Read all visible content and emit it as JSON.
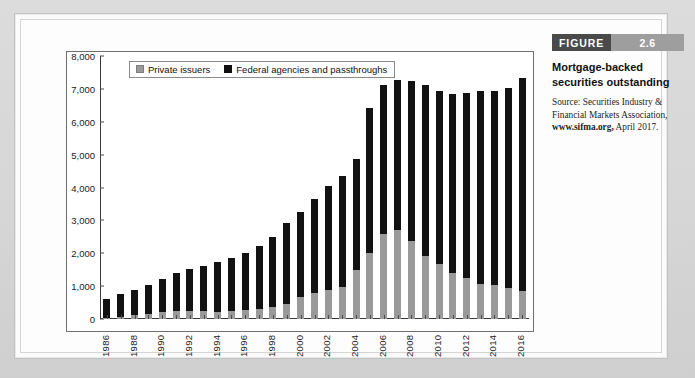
{
  "caption": {
    "figure_word": "FIGURE",
    "figure_number": "2.6",
    "title": "Mortgage-backed securities outstanding",
    "source_prefix": "Source: Securities Industry & Financial Markets Association, ",
    "source_link": "www.sifma.org,",
    "source_suffix": " April 2017."
  },
  "colors": {
    "private_issuers": "#9a9a9a",
    "federal_agencies": "#121212",
    "figure_word_bg": "#4a4a4a",
    "figure_num_bg": "#9e9e9e",
    "page_bg": "#d8d8d8",
    "card_bg": "#fbfbfb"
  },
  "chart_data": {
    "type": "bar",
    "stacked": true,
    "title": "Mortgage-backed securities outstanding",
    "xlabel": "",
    "ylabel": "$ billion",
    "ylim": [
      0,
      8000
    ],
    "ytick_values": [
      0,
      1000,
      2000,
      3000,
      4000,
      5000,
      6000,
      7000,
      8000
    ],
    "ytick_labels": [
      "0",
      "1,000",
      "2,000",
      "3,000",
      "4,000",
      "5,000",
      "6,000",
      "7,000",
      "8,000"
    ],
    "grid": false,
    "legend_position": "top-left-inside",
    "categories": [
      "1986",
      "1987",
      "1988",
      "1989",
      "1990",
      "1991",
      "1992",
      "1993",
      "1994",
      "1995",
      "1996",
      "1997",
      "1998",
      "1999",
      "2000",
      "2001",
      "2002",
      "2003",
      "2004",
      "2005",
      "2006",
      "2007",
      "2008",
      "2009",
      "2010",
      "2011",
      "2012",
      "2013",
      "2014",
      "2015",
      "2016"
    ],
    "xtick_labels_shown": [
      "1986",
      "1988",
      "1990",
      "1992",
      "1994",
      "1996",
      "1998",
      "2000",
      "2002",
      "2004",
      "2006",
      "2008",
      "2010",
      "2012",
      "2014",
      "2016"
    ],
    "series": [
      {
        "name": "Private issuers",
        "color": "#9a9a9a",
        "values": [
          30,
          60,
          110,
          150,
          200,
          230,
          250,
          230,
          210,
          230,
          260,
          310,
          360,
          460,
          680,
          790,
          880,
          960,
          1480,
          2000,
          2580,
          2700,
          2370,
          1930,
          1660,
          1400,
          1250,
          1080,
          1020,
          930,
          860
        ]
      },
      {
        "name": "Federal agencies and passthroughs",
        "color": "#121212",
        "values": [
          570,
          700,
          770,
          900,
          1030,
          1170,
          1270,
          1390,
          1520,
          1620,
          1760,
          1910,
          2130,
          2460,
          2570,
          2850,
          3160,
          3400,
          3390,
          4410,
          4540,
          4570,
          4860,
          5180,
          5280,
          5460,
          5620,
          5870,
          5930,
          6110,
          6460
        ]
      }
    ],
    "totals": [
      600,
      760,
      880,
      1050,
      1230,
      1400,
      1520,
      1620,
      1730,
      1850,
      2020,
      2220,
      2490,
      2920,
      3250,
      3640,
      4040,
      4360,
      4870,
      6410,
      7120,
      7270,
      7230,
      7110,
      6940,
      6860,
      6870,
      6950,
      6950,
      7040,
      7320
    ]
  }
}
